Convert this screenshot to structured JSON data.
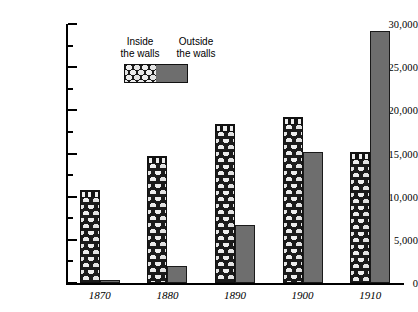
{
  "chart_data": {
    "type": "bar",
    "title": "",
    "subtitle": "",
    "xlabel": "",
    "ylabel": "",
    "categories": [
      "1870",
      "1880",
      "1890",
      "1900",
      "1910"
    ],
    "series": [
      {
        "name": "Inside the walls",
        "values": [
          10800,
          14700,
          18400,
          19200,
          15200
        ]
      },
      {
        "name": "Outside the walls",
        "values": [
          400,
          2000,
          6700,
          15200,
          29200
        ]
      }
    ],
    "ylim": [
      0,
      30000
    ],
    "ytick_values": [
      0,
      5000,
      10000,
      15000,
      20000,
      25000,
      30000
    ],
    "ytick_labels": [
      "0",
      "5,000",
      "10,000",
      "15,000",
      "20,000",
      "25,000",
      "30,000"
    ],
    "yminor_values": [
      2500,
      7500,
      12500,
      17500,
      22500,
      27500
    ],
    "grid": false,
    "legend_position": "top-left-inside",
    "legend": [
      {
        "label_line1": "Inside",
        "label_line2": "the walls",
        "swatch": "stone-masonry"
      },
      {
        "label_line1": "Outside",
        "label_line2": "the walls",
        "swatch": "solid-gray"
      }
    ]
  },
  "colors": {
    "outside_fill": "#6e6e6e",
    "inside_stone": "#ececec",
    "inside_mortar": "#1b1b1b",
    "axis": "#000000",
    "background": "#ffffff"
  }
}
